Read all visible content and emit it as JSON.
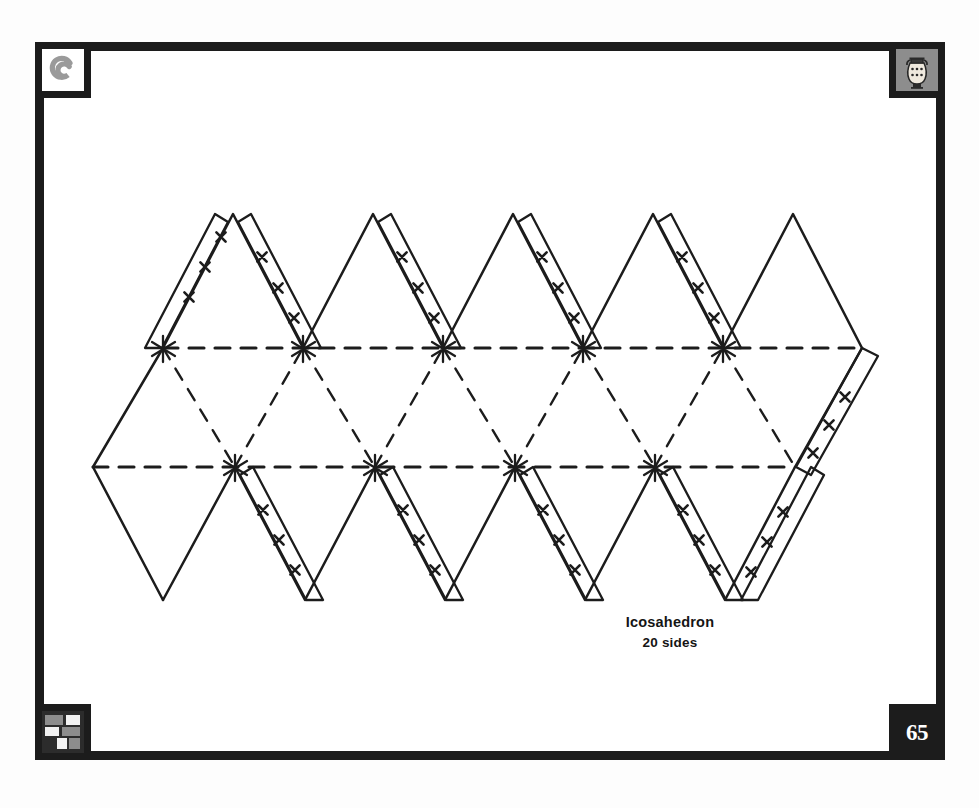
{
  "page": {
    "number": "65",
    "background": "#ffffff",
    "ink": "#1c1c1c"
  },
  "frame": {
    "border_color": "#1c1c1c",
    "corners": [
      {
        "position": "top-left",
        "icon": "spiral-icon",
        "label": "spiral"
      },
      {
        "position": "top-right",
        "icon": "greek-vase-icon",
        "label": "greek vase"
      },
      {
        "position": "bottom-left",
        "icon": "mosaic-tiles-icon",
        "label": "mosaic tiles"
      },
      {
        "position": "bottom-right",
        "icon": "page-number",
        "label": "65"
      }
    ]
  },
  "caption": {
    "title": "Icosahedron",
    "subtitle": "20 sides"
  },
  "diagram": {
    "name": "icosahedron-net",
    "type": "polyhedron-net",
    "solid": "Icosahedron",
    "faces": 20,
    "face_shape": "equilateral triangle",
    "line_styles": {
      "cut": "solid",
      "fold": "dashed",
      "glue_mark": "x"
    },
    "glue_tab_marks": "x x x",
    "glue_tab_count": 10,
    "top_row_triangles": 5,
    "bottom_row_triangles": 5,
    "middle_band_triangles": 10,
    "geometry": {
      "top_fold_y": 348,
      "bottom_fold_y": 467,
      "apex_top_y": 214,
      "apex_bottom_y": 600,
      "half_width": 70,
      "left_x": 93,
      "right_x": 862,
      "top_fold_x_start": 163,
      "top_fold_x_end": 862,
      "bottom_fold_x_start": 93,
      "bottom_fold_x_end": 795
    }
  }
}
